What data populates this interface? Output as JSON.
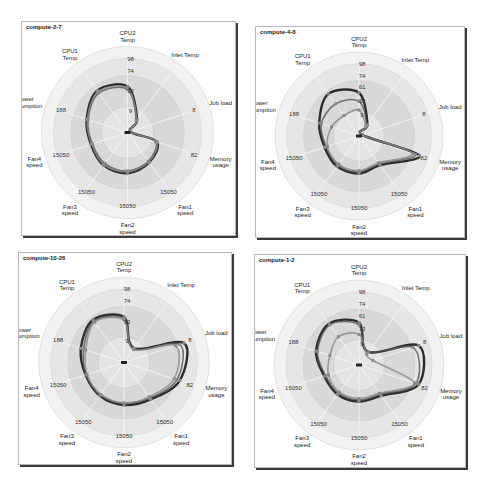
{
  "chart_data": [
    {
      "type": "radar",
      "title": "compute-2-7",
      "axes": [
        "CPU2 Temp",
        "Inlet Temp",
        "Job load",
        "Memory usage",
        "Fan1 speed",
        "Fan2 speed",
        "Fan3 speed",
        "Fan4 speed",
        "Power consumption",
        "CPU1 Temp"
      ],
      "tick_labels": {
        "CPU2 Temp": [
          "9",
          "33",
          "74",
          "98"
        ],
        "Job load": "8",
        "Memory usage": "82",
        "Fan1 speed": "15050",
        "Fan2 speed": "15050",
        "Fan3 speed": "15050",
        "Fan4 speed": "15050",
        "Power consumption": "188"
      },
      "series": [
        {
          "name": "s1",
          "values": [
            0.62,
            0.22,
            0.04,
            0.42,
            0.5,
            0.55,
            0.55,
            0.52,
            0.58,
            0.7
          ]
        },
        {
          "name": "s2",
          "values": [
            0.58,
            0.2,
            0.04,
            0.4,
            0.48,
            0.52,
            0.52,
            0.5,
            0.56,
            0.66
          ]
        },
        {
          "name": "s3",
          "values": [
            0.6,
            0.21,
            0.04,
            0.41,
            0.49,
            0.53,
            0.54,
            0.51,
            0.57,
            0.68
          ]
        }
      ],
      "rlim": [
        0,
        1
      ]
    },
    {
      "type": "radar",
      "title": "compute-4-8",
      "axes": [
        "CPU2 Temp",
        "Inlet Temp",
        "Job load",
        "Memory usage",
        "Fan1 speed",
        "Fan2 speed",
        "Fan3 speed",
        "Fan4 speed",
        "Power consumption",
        "CPU1 Temp"
      ],
      "tick_labels": {
        "CPU2 Temp": [
          "9",
          "33",
          "61",
          "74",
          "98"
        ],
        "Job load": "8",
        "Memory usage": "82",
        "Fan1 speed": "15050",
        "Fan2 speed": "15050",
        "Fan3 speed": "15050",
        "Fan4 speed": "15050",
        "Power consumption": "188"
      },
      "series": [
        {
          "name": "s1",
          "values": [
            0.6,
            0.2,
            0.05,
            0.88,
            0.5,
            0.52,
            0.52,
            0.5,
            0.58,
            0.72
          ]
        },
        {
          "name": "s2",
          "values": [
            0.48,
            0.18,
            0.05,
            0.82,
            0.48,
            0.5,
            0.5,
            0.48,
            0.55,
            0.55
          ]
        },
        {
          "name": "s3",
          "values": [
            0.36,
            0.16,
            0.05,
            0.78,
            0.46,
            0.48,
            0.48,
            0.46,
            0.4,
            0.35
          ]
        }
      ],
      "rlim": [
        0,
        1
      ]
    },
    {
      "type": "radar",
      "title": "compute-10-26",
      "axes": [
        "CPU2 Temp",
        "Inlet Temp",
        "Job load",
        "Memory usage",
        "Fan1 speed",
        "Fan2 speed",
        "Fan3 speed",
        "Fan4 speed",
        "Power consumption",
        "CPU1 Temp"
      ],
      "tick_labels": {
        "CPU2 Temp": [
          "9",
          "33",
          "74",
          "98"
        ],
        "Job load": "8",
        "Memory usage": "82",
        "Fan1 speed": "15050",
        "Fan2 speed": "15050",
        "Fan3 speed": "15050",
        "Fan4 speed": "15050",
        "Power consumption": "188"
      },
      "series": [
        {
          "name": "s1",
          "values": [
            0.62,
            0.24,
            0.86,
            0.8,
            0.62,
            0.58,
            0.56,
            0.55,
            0.62,
            0.72
          ]
        },
        {
          "name": "s2",
          "values": [
            0.6,
            0.23,
            0.8,
            0.76,
            0.6,
            0.56,
            0.55,
            0.54,
            0.58,
            0.7
          ]
        },
        {
          "name": "s3",
          "values": [
            0.58,
            0.22,
            0.74,
            0.72,
            0.58,
            0.55,
            0.54,
            0.53,
            0.55,
            0.68
          ]
        }
      ],
      "rlim": [
        0,
        1
      ]
    },
    {
      "type": "radar",
      "title": "compute-1-2",
      "axes": [
        "CPU2 Temp",
        "Inlet Temp",
        "Job load",
        "Memory usage",
        "Fan1 speed",
        "Fan2 speed",
        "Fan3 speed",
        "Fan4 speed",
        "Power consumption",
        "CPU1 Temp"
      ],
      "tick_labels": {
        "CPU2 Temp": [
          "9",
          "33",
          "61",
          "74",
          "98"
        ],
        "Job load": "8",
        "Memory usage": "82",
        "Fan1 speed": "15050",
        "Fan2 speed": "15050",
        "Fan3 speed": "15050",
        "Fan4 speed": "15050",
        "Power consumption": "188"
      },
      "series": [
        {
          "name": "s1",
          "values": [
            0.58,
            0.22,
            0.86,
            0.86,
            0.52,
            0.5,
            0.5,
            0.5,
            0.62,
            0.7
          ]
        },
        {
          "name": "s2",
          "values": [
            0.55,
            0.22,
            0.78,
            0.82,
            0.5,
            0.48,
            0.48,
            0.48,
            0.6,
            0.68
          ]
        },
        {
          "name": "s3",
          "values": [
            0.42,
            0.18,
            0.2,
            0.8,
            0.48,
            0.46,
            0.46,
            0.44,
            0.42,
            0.48
          ]
        }
      ],
      "rlim": [
        0,
        1
      ]
    }
  ],
  "panels": [
    {
      "title": "compute-2-7"
    },
    {
      "title": "compute-4-8"
    },
    {
      "title": "compute-10-26"
    },
    {
      "title": "compute-1-2"
    }
  ],
  "axis_labels": {
    "cpu2": [
      "CPU2",
      "Temp"
    ],
    "inlet": [
      "Inlet Temp"
    ],
    "job": [
      "Job load"
    ],
    "mem": [
      "Memory",
      "usage"
    ],
    "fan1": [
      "Fan1",
      "speed"
    ],
    "fan2": [
      "Fan2",
      "speed"
    ],
    "fan3": [
      "Fan3",
      "speed"
    ],
    "fan4": [
      "Fan4",
      "speed"
    ],
    "power": [
      "Power",
      "consumption"
    ],
    "cpu1": [
      "CPU1",
      "Temp"
    ]
  },
  "colors": {
    "series": [
      "#222222",
      "#555555",
      "#888888"
    ],
    "ring_outer": "#f2f2f2",
    "ring_mid": "#e6e6e6",
    "ring_inner": "#d8d8d8"
  }
}
